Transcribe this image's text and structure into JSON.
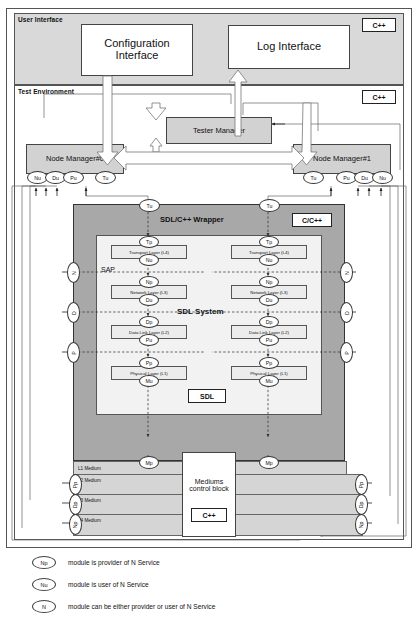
{
  "diagram": {
    "bands": [
      {
        "name": "user-interface",
        "label": "User Interface",
        "badge": "C++"
      },
      {
        "name": "test-environment",
        "label": "Test Environment",
        "badge": "C++"
      }
    ],
    "top_boxes": [
      {
        "name": "configuration-interface",
        "label": "Configuration\nInterface"
      },
      {
        "name": "log-interface",
        "label": "Log Interface"
      }
    ],
    "tester_manager": {
      "label": "Tester Manager"
    },
    "comparison_link": {
      "label": "Comparison link"
    },
    "node_managers": [
      {
        "name": "node-manager-0",
        "label": "Node Manager#0",
        "ports_left": [
          "Nu",
          "Du",
          "Pu"
        ],
        "ports_right": [
          "Tu"
        ]
      },
      {
        "name": "node-manager-1",
        "label": "Node Manager#1",
        "ports_left": [
          "Tu"
        ],
        "ports_right": [
          "Pu",
          "Du",
          "Nu"
        ]
      }
    ],
    "wrapper": {
      "label": "SDL/C++ Wrapper",
      "badge": "C/C++",
      "ports_top": [
        "Tu",
        "Tu"
      ]
    },
    "sdl_system": {
      "label": "SDL System",
      "badge": "SDL",
      "sap_label": "SAP",
      "stacks": [
        {
          "name": "stack-left",
          "layers": [
            {
              "top_port": "Tp",
              "label": "Transport Layer (L4)",
              "bottom_port": "Nu"
            },
            {
              "top_port": "Np",
              "label": "Network Layer (L3)",
              "bottom_port": "Du"
            },
            {
              "top_port": "Dp",
              "label": "Data Link Layer (L2)",
              "bottom_port": "Pu"
            },
            {
              "top_port": "Pp",
              "label": "Physical Layer (L1)",
              "bottom_port": "Mu"
            }
          ]
        },
        {
          "name": "stack-right",
          "layers": [
            {
              "top_port": "Tp",
              "label": "Transport Layer (L4)",
              "bottom_port": "Nu"
            },
            {
              "top_port": "Np",
              "label": "Network Layer (L3)",
              "bottom_port": "Du"
            },
            {
              "top_port": "Dp",
              "label": "Data Link Layer (L2)",
              "bottom_port": "Pu"
            },
            {
              "top_port": "Pp",
              "label": "Physical Layer (L1)",
              "bottom_port": "Mu"
            }
          ]
        }
      ]
    },
    "sap_ports_left": [
      "N",
      "D",
      "P"
    ],
    "sap_ports_right": [
      "N",
      "D",
      "P"
    ],
    "mediums": {
      "badge": "C++",
      "rows": [
        {
          "label": "L1 Medium",
          "port": "Mp"
        },
        {
          "label": "L2 Medium",
          "port": "Pp"
        },
        {
          "label": "L3 Medium",
          "port": "Dp"
        },
        {
          "label": "L4 Medium",
          "port": "Np"
        }
      ],
      "control_block": {
        "label": "Mediums\ncontrol block",
        "badge": "C++"
      }
    },
    "legend": [
      {
        "symbol": "Np",
        "text": "module is provider of N Service"
      },
      {
        "symbol": "Nu",
        "text": "module is user of N Service"
      },
      {
        "symbol": "N",
        "text": "module can be either provider or user of N Service"
      }
    ],
    "colors": {
      "panel_gray": "#d9d9d9",
      "wrapper_gray": "#a8a8a8",
      "sdl_gray": "#f2f2f2",
      "box_gray": "#d2d2d2",
      "medium_gray": "#d5d5d5",
      "stroke": "#333333"
    }
  }
}
